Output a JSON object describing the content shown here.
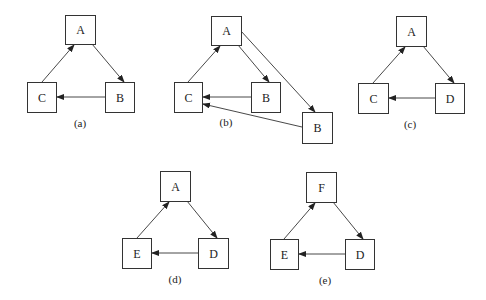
{
  "diagrams": [
    {
      "caption": "(a)",
      "caption_pos": [
        80,
        123
      ],
      "nodes": [
        {
          "id": "a_A",
          "label": "A",
          "x": 65,
          "y": 15,
          "w": 30,
          "h": 29
        },
        {
          "id": "a_C",
          "label": "C",
          "x": 27,
          "y": 82,
          "w": 29,
          "h": 30
        },
        {
          "id": "a_B",
          "label": "B",
          "x": 105,
          "y": 82,
          "w": 29,
          "h": 30
        }
      ],
      "edges": [
        {
          "from": "A",
          "to": "B",
          "x1": 92,
          "y1": 44,
          "x2": 124,
          "y2": 82
        },
        {
          "from": "B",
          "to": "C",
          "x1": 105,
          "y1": 97,
          "x2": 57,
          "y2": 97
        },
        {
          "from": "C",
          "to": "A",
          "x1": 42,
          "y1": 82,
          "x2": 74,
          "y2": 45
        }
      ]
    },
    {
      "caption": "(b)",
      "caption_pos": [
        226,
        122
      ],
      "nodes": [
        {
          "id": "b_A",
          "label": "A",
          "x": 211,
          "y": 16,
          "w": 30,
          "h": 29
        },
        {
          "id": "b_C",
          "label": "C",
          "x": 174,
          "y": 82,
          "w": 28,
          "h": 30
        },
        {
          "id": "b_B1",
          "label": "B",
          "x": 251,
          "y": 82,
          "w": 29,
          "h": 30
        },
        {
          "id": "b_B2",
          "label": "B",
          "x": 302,
          "y": 112,
          "w": 30,
          "h": 31
        }
      ],
      "edges": [
        {
          "from": "A",
          "to": "B",
          "x1": 238,
          "y1": 45,
          "x2": 269,
          "y2": 82
        },
        {
          "from": "A",
          "to": "B",
          "x1": 241,
          "y1": 31,
          "x2": 315,
          "y2": 112
        },
        {
          "from": "B",
          "to": "C",
          "x1": 251,
          "y1": 97,
          "x2": 203,
          "y2": 97
        },
        {
          "from": "B",
          "to": "C",
          "x1": 302,
          "y1": 127,
          "x2": 203,
          "y2": 104
        },
        {
          "from": "C",
          "to": "A",
          "x1": 188,
          "y1": 82,
          "x2": 220,
          "y2": 46
        }
      ]
    },
    {
      "caption": "(c)",
      "caption_pos": [
        410,
        124
      ],
      "nodes": [
        {
          "id": "c_A",
          "label": "A",
          "x": 396,
          "y": 16,
          "w": 30,
          "h": 30
        },
        {
          "id": "c_C",
          "label": "C",
          "x": 358,
          "y": 83,
          "w": 30,
          "h": 30
        },
        {
          "id": "c_D",
          "label": "D",
          "x": 435,
          "y": 83,
          "w": 29,
          "h": 30
        }
      ],
      "edges": [
        {
          "from": "A",
          "to": "D",
          "x1": 423,
          "y1": 46,
          "x2": 454,
          "y2": 83
        },
        {
          "from": "D",
          "to": "C",
          "x1": 435,
          "y1": 98,
          "x2": 389,
          "y2": 98
        },
        {
          "from": "C",
          "to": "A",
          "x1": 373,
          "y1": 83,
          "x2": 405,
          "y2": 47
        }
      ]
    },
    {
      "caption": "(d)",
      "caption_pos": [
        175,
        279
      ],
      "nodes": [
        {
          "id": "d_A",
          "label": "A",
          "x": 160,
          "y": 171,
          "w": 30,
          "h": 30
        },
        {
          "id": "d_E",
          "label": "E",
          "x": 122,
          "y": 238,
          "w": 29,
          "h": 30
        },
        {
          "id": "d_D",
          "label": "D",
          "x": 198,
          "y": 238,
          "w": 30,
          "h": 30
        }
      ],
      "edges": [
        {
          "from": "A",
          "to": "D",
          "x1": 187,
          "y1": 201,
          "x2": 217,
          "y2": 238
        },
        {
          "from": "D",
          "to": "E",
          "x1": 198,
          "y1": 253,
          "x2": 152,
          "y2": 253
        },
        {
          "from": "E",
          "to": "A",
          "x1": 137,
          "y1": 238,
          "x2": 169,
          "y2": 202
        }
      ]
    },
    {
      "caption": "(e)",
      "caption_pos": [
        325,
        280
      ],
      "nodes": [
        {
          "id": "e_F",
          "label": "F",
          "x": 306,
          "y": 172,
          "w": 30,
          "h": 30
        },
        {
          "id": "e_E",
          "label": "E",
          "x": 270,
          "y": 239,
          "w": 28,
          "h": 30
        },
        {
          "id": "e_D",
          "label": "D",
          "x": 345,
          "y": 239,
          "w": 29,
          "h": 30
        }
      ],
      "edges": [
        {
          "from": "F",
          "to": "D",
          "x1": 333,
          "y1": 202,
          "x2": 363,
          "y2": 239
        },
        {
          "from": "D",
          "to": "E",
          "x1": 345,
          "y1": 254,
          "x2": 299,
          "y2": 254
        },
        {
          "from": "E",
          "to": "F",
          "x1": 284,
          "y1": 239,
          "x2": 315,
          "y2": 203
        }
      ]
    }
  ]
}
